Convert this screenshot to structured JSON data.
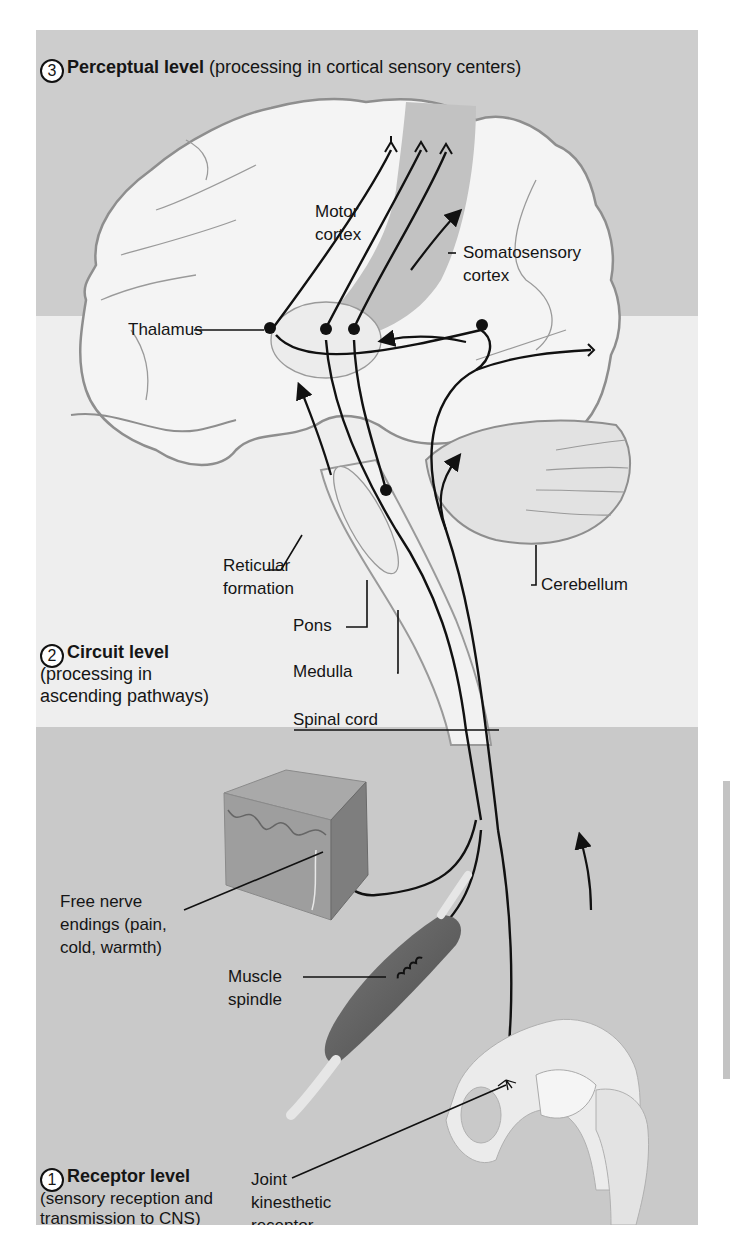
{
  "levels": {
    "perceptual": {
      "number": "3",
      "title": "Perceptual level",
      "desc": "(processing in cortical sensory centers)"
    },
    "circuit": {
      "number": "2",
      "title": "Circuit level",
      "desc_line1": "(processing in",
      "desc_line2": "ascending pathways)"
    },
    "receptor": {
      "number": "1",
      "title": "Receptor level",
      "desc_line1": "(sensory reception and",
      "desc_line2": "transmission to CNS)"
    }
  },
  "labels": {
    "motor_cortex": [
      "Motor",
      "cortex"
    ],
    "somatosensory_cortex": [
      "Somatosensory",
      "cortex"
    ],
    "thalamus": "Thalamus",
    "reticular_formation": [
      "Reticular",
      "formation"
    ],
    "pons": "Pons",
    "medulla": "Medulla",
    "cerebellum": "Cerebellum",
    "spinal_cord": "Spinal cord",
    "free_nerve_endings": [
      "Free nerve",
      "endings (pain,",
      "cold, warmth)"
    ],
    "muscle_spindle": [
      "Muscle",
      "spindle"
    ],
    "joint_receptor": [
      "Joint",
      "kinesthetic",
      "receptor"
    ]
  },
  "colors": {
    "band_top": "#cdcdcd",
    "band_mid": "#eeeeee",
    "band_bottom": "#c9c9c9",
    "brain_fill": "#f4f4f4",
    "somatosensory_strip": "#bdbdbd",
    "outline": "#8e8e8e",
    "nerve": "#111111"
  }
}
